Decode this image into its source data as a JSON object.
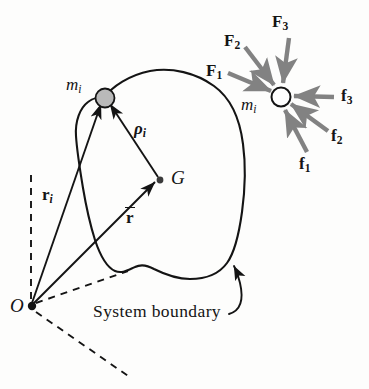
{
  "figure": {
    "background_color": "#fdfdfc",
    "line_color": "#141414",
    "arrow_gray": "#828282",
    "particle_fill": "#b9b9b9",
    "caption": "System boundary",
    "labels": {
      "mass_body": "m",
      "mass_body_sub": "i",
      "mass_free": "m",
      "mass_free_sub": "i",
      "centroid": "G",
      "origin": "O",
      "rho": "ρ",
      "rho_sub": "i",
      "r_i": "r",
      "r_i_sub": "i",
      "r_bar": "r"
    },
    "external_forces": [
      {
        "name": "F1",
        "symbol": "F",
        "sub": "1"
      },
      {
        "name": "F2",
        "symbol": "F",
        "sub": "2"
      },
      {
        "name": "F3",
        "symbol": "F",
        "sub": "3"
      }
    ],
    "internal_forces": [
      {
        "name": "f1",
        "symbol": "f",
        "sub": "1"
      },
      {
        "name": "f2",
        "symbol": "f",
        "sub": "2"
      },
      {
        "name": "f3",
        "symbol": "f",
        "sub": "3"
      }
    ]
  }
}
